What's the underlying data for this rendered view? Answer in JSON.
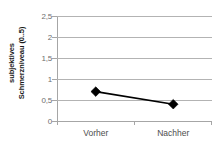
{
  "chart_data": {
    "type": "line",
    "title": "",
    "xlabel": "",
    "ylabel_line1": "subjektives",
    "ylabel_line2": "Schmerzniveau (0..5)",
    "ylabel": "subjektives Schmerzniveau (0..5)",
    "categories": [
      "Vorher",
      "Nachher"
    ],
    "values": [
      0.7,
      0.4
    ],
    "series": [
      {
        "name": "Schmerzniveau",
        "values": [
          0.7,
          0.4
        ]
      }
    ],
    "ylim": [
      0,
      2.5
    ],
    "ytick_values": [
      0,
      0.5,
      1,
      1.5,
      2,
      2.5
    ],
    "ytick_labels": [
      "0",
      "0,5",
      "1",
      "1,5",
      "2",
      "2,5"
    ],
    "grid": true,
    "legend": "none",
    "marker": "diamond",
    "colors": {
      "series_line": "#000000",
      "marker": "#000000",
      "gridline": "#b3b3b3",
      "axis": "#a6a6a6",
      "tick_text": "#6e6e6e",
      "axis_label_text": "#1a1a1a",
      "background": "#ffffff"
    }
  }
}
